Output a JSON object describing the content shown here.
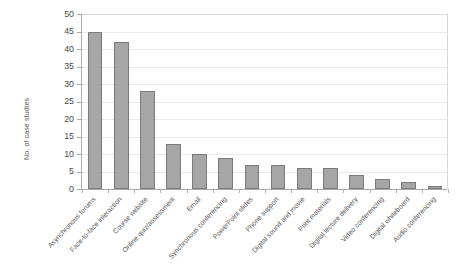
{
  "chart_data": {
    "type": "bar",
    "title": "",
    "xlabel": "",
    "ylabel": "No. of case studies",
    "ylim": [
      0,
      50
    ],
    "ytick_step": 5,
    "yticks": [
      50,
      45,
      40,
      35,
      30,
      25,
      20,
      15,
      10,
      5,
      0
    ],
    "grid": true,
    "legend": null,
    "bar_color": "#a6a6a6",
    "bar_border_color": "#7b7b7b",
    "categories": [
      "Asynchronous forums",
      "Face-to-face interaction",
      "Course website",
      "Online quiz/assessment",
      "Email",
      "Synchronous conferencing",
      "PowerPoint slides",
      "Phone support",
      "Digital sound and movie",
      "Print materials",
      "Digital lecture delivery",
      "Video conferencing",
      "Digital whiteboard",
      "Audio conferencing"
    ],
    "values": [
      45,
      42,
      28,
      13,
      10,
      9,
      7,
      7,
      6,
      6,
      4,
      3,
      2,
      1
    ]
  }
}
